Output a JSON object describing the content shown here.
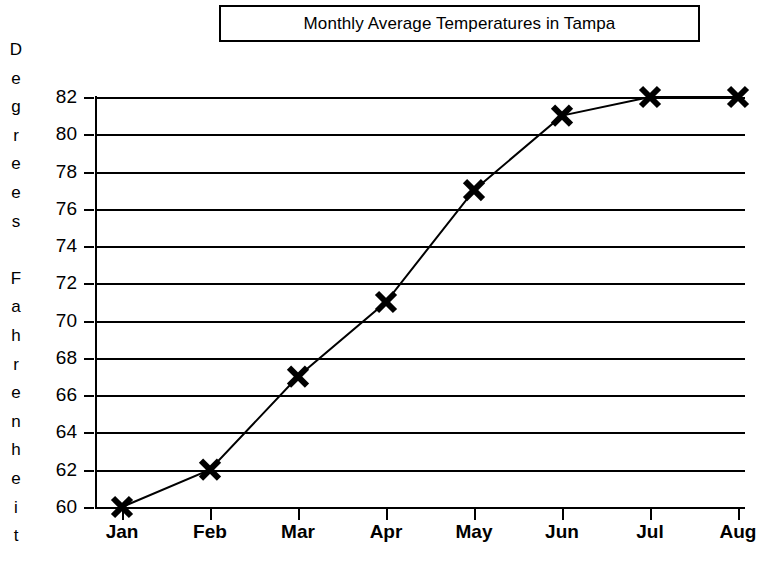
{
  "chart_data": {
    "type": "line",
    "title": "Monthly Average Temperatures in Tampa",
    "xlabel": "",
    "ylabel": "Degrees Fahrenheit",
    "categories": [
      "Jan",
      "Feb",
      "Mar",
      "Apr",
      "May",
      "Jun",
      "Jul",
      "Aug"
    ],
    "values": [
      60,
      62,
      67,
      71,
      77,
      81,
      82,
      82
    ],
    "series": [
      {
        "name": "Monthly Average Temperature",
        "values": [
          60,
          62,
          67,
          71,
          77,
          81,
          82,
          82
        ]
      }
    ],
    "ylim": [
      60,
      82
    ],
    "ytick_labels": [
      "82",
      "80",
      "78",
      "76",
      "74",
      "72",
      "70",
      "68",
      "66",
      "64",
      "62",
      "60"
    ],
    "ytick_values": [
      82,
      80,
      78,
      76,
      74,
      72,
      70,
      68,
      66,
      64,
      62,
      60
    ],
    "ytick_step": 2,
    "grid": true,
    "grid_axis": "y",
    "legend": false,
    "legend_position": "none",
    "marker": "x",
    "line_color": "#000000",
    "marker_color": "#000000",
    "background_color": "#ffffff",
    "ylabel_letters": [
      "D",
      "e",
      "g",
      "r",
      "e",
      "e",
      "s",
      "",
      "F",
      "a",
      "h",
      "r",
      "e",
      "n",
      "h",
      "e",
      "i",
      "t"
    ]
  }
}
